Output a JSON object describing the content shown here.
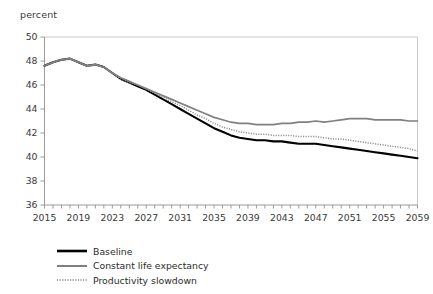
{
  "chart_data": {
    "type": "line",
    "title": "",
    "subtitle": "",
    "xlabel": "",
    "ylabel": "percent",
    "ylim": [
      36,
      50
    ],
    "xlim": [
      2015,
      2059
    ],
    "y_ticks": [
      36,
      38,
      40,
      42,
      44,
      46,
      48,
      50
    ],
    "x_ticks": [
      2015,
      2019,
      2023,
      2027,
      2031,
      2035,
      2039,
      2043,
      2047,
      2051,
      2055,
      2059
    ],
    "x_minor_tick_step": 1,
    "grid": false,
    "legend_position": "bottom-left",
    "colors": {
      "baseline": "#000000",
      "constant_life_expectancy": "#808080",
      "productivity_slowdown": "#8a8a8a",
      "axis": "#b0b0b0",
      "text": "#333333"
    },
    "x": [
      2015,
      2016,
      2017,
      2018,
      2019,
      2020,
      2021,
      2022,
      2023,
      2024,
      2025,
      2026,
      2027,
      2028,
      2029,
      2030,
      2031,
      2032,
      2033,
      2034,
      2035,
      2036,
      2037,
      2038,
      2039,
      2040,
      2041,
      2042,
      2043,
      2044,
      2045,
      2046,
      2047,
      2048,
      2049,
      2050,
      2051,
      2052,
      2053,
      2054,
      2055,
      2056,
      2057,
      2058,
      2059
    ],
    "series": [
      {
        "name": "Baseline",
        "style": "solid-thick",
        "color": "#000000",
        "values": [
          47.6,
          47.9,
          48.1,
          48.2,
          47.9,
          47.6,
          47.7,
          47.5,
          47.0,
          46.5,
          46.2,
          45.9,
          45.6,
          45.2,
          44.8,
          44.4,
          44.0,
          43.6,
          43.2,
          42.8,
          42.4,
          42.1,
          41.8,
          41.6,
          41.5,
          41.4,
          41.4,
          41.3,
          41.3,
          41.2,
          41.1,
          41.1,
          41.1,
          41.0,
          40.9,
          40.8,
          40.7,
          40.6,
          40.5,
          40.4,
          40.3,
          40.2,
          40.1,
          40.0,
          39.9
        ]
      },
      {
        "name": "Constant life expectancy",
        "style": "solid",
        "color": "#808080",
        "values": [
          47.6,
          47.9,
          48.1,
          48.2,
          47.9,
          47.6,
          47.7,
          47.5,
          47.0,
          46.6,
          46.3,
          46.0,
          45.7,
          45.4,
          45.1,
          44.8,
          44.5,
          44.2,
          43.9,
          43.6,
          43.3,
          43.1,
          42.9,
          42.8,
          42.8,
          42.7,
          42.7,
          42.7,
          42.8,
          42.8,
          42.9,
          42.9,
          43.0,
          42.9,
          43.0,
          43.1,
          43.2,
          43.2,
          43.2,
          43.1,
          43.1,
          43.1,
          43.1,
          43.0,
          43.0
        ]
      },
      {
        "name": "Productivity slowdown",
        "style": "dotted",
        "color": "#8a8a8a",
        "values": [
          47.6,
          47.9,
          48.1,
          48.2,
          47.9,
          47.6,
          47.7,
          47.5,
          47.0,
          46.5,
          46.2,
          46.0,
          45.7,
          45.3,
          45.0,
          44.6,
          44.3,
          43.9,
          43.5,
          43.2,
          42.8,
          42.5,
          42.3,
          42.1,
          42.0,
          41.9,
          41.9,
          41.8,
          41.8,
          41.8,
          41.7,
          41.7,
          41.7,
          41.6,
          41.5,
          41.5,
          41.4,
          41.3,
          41.2,
          41.1,
          41.0,
          40.9,
          40.8,
          40.7,
          40.5
        ]
      }
    ]
  },
  "legend": {
    "items": [
      {
        "label": "Baseline"
      },
      {
        "label": "Constant life expectancy"
      },
      {
        "label": "Productivity slowdown"
      }
    ]
  }
}
